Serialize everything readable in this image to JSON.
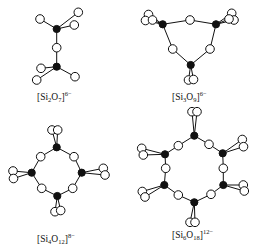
{
  "figure": {
    "width": 255,
    "height": 249,
    "colors": {
      "line": "#111111",
      "oxygen_fill": "#ffffff",
      "silicon_fill": "#111111",
      "background": "#ffffff"
    },
    "atom_radius": {
      "O": 4.3,
      "Si": 3.6
    },
    "legend_hint": "filled circle = Si, open circle = O"
  },
  "structures": [
    {
      "id": "si2o7",
      "label": {
        "prefix": "[Si",
        "n_si": "2",
        "o": "O",
        "n_o": "7",
        "close": "]",
        "charge": "6−",
        "x": 37,
        "y": 91
      },
      "si": [
        [
          56.7,
          29
        ],
        [
          56.7,
          66.7
        ]
      ],
      "o": [
        [
          56.7,
          47.7
        ],
        [
          40,
          19
        ],
        [
          78.3,
          12.3
        ],
        [
          74.3,
          25
        ],
        [
          41,
          68.3
        ],
        [
          36.7,
          80
        ],
        [
          75,
          76.7
        ]
      ],
      "bonds": [
        [
          0,
          0
        ],
        [
          0,
          1
        ],
        [
          0,
          2
        ],
        [
          0,
          3
        ],
        [
          1,
          0
        ],
        [
          1,
          4
        ],
        [
          1,
          5
        ],
        [
          1,
          6
        ]
      ]
    },
    {
      "id": "si3o9",
      "label": {
        "prefix": "[Si",
        "n_si": "3",
        "o": "O",
        "n_o": "9",
        "close": "]",
        "charge": "6−",
        "x": 172,
        "y": 91
      },
      "si": [
        [
          162.7,
          24.3
        ],
        [
          216,
          24.3
        ],
        [
          190.7,
          65
        ]
      ],
      "o": [
        [
          190,
          20
        ],
        [
          172.7,
          49
        ],
        [
          210,
          49
        ],
        [
          148.5,
          14.5
        ],
        [
          145.5,
          20.5
        ],
        [
          152.5,
          20
        ],
        [
          231.7,
          13.3
        ],
        [
          234,
          20
        ],
        [
          229,
          19
        ],
        [
          188.5,
          80
        ],
        [
          193.5,
          79.5
        ]
      ],
      "bonds": [
        [
          0,
          0
        ],
        [
          1,
          0
        ],
        [
          0,
          1
        ],
        [
          2,
          1
        ],
        [
          1,
          2
        ],
        [
          2,
          2
        ],
        [
          0,
          3
        ],
        [
          0,
          4
        ],
        [
          0,
          5
        ],
        [
          1,
          6
        ],
        [
          1,
          7
        ],
        [
          1,
          8
        ],
        [
          2,
          9
        ],
        [
          2,
          10
        ]
      ]
    },
    {
      "id": "si4o12",
      "label": {
        "prefix": "[Si",
        "n_si": "4",
        "o": "O",
        "n_o": "12",
        "close": "]",
        "charge": "8−",
        "x": 37,
        "y": 233
      },
      "si": [
        [
          56.7,
          147.3
        ],
        [
          31.7,
          172.7
        ],
        [
          81.7,
          172.7
        ],
        [
          57.3,
          196
        ]
      ],
      "o": [
        [
          40.7,
          156.7
        ],
        [
          74,
          156.7
        ],
        [
          41.7,
          188.3
        ],
        [
          72.7,
          188.3
        ],
        [
          52,
          130
        ],
        [
          57.7,
          130
        ],
        [
          13,
          171
        ],
        [
          13.5,
          178.5
        ],
        [
          103.3,
          168.3
        ],
        [
          105,
          175
        ],
        [
          55,
          211.7
        ],
        [
          60.7,
          210.5
        ]
      ],
      "bonds": [
        [
          0,
          0
        ],
        [
          1,
          0
        ],
        [
          0,
          1
        ],
        [
          2,
          1
        ],
        [
          1,
          2
        ],
        [
          3,
          2
        ],
        [
          2,
          3
        ],
        [
          3,
          3
        ],
        [
          0,
          4
        ],
        [
          0,
          5
        ],
        [
          1,
          6
        ],
        [
          1,
          7
        ],
        [
          2,
          8
        ],
        [
          2,
          9
        ],
        [
          3,
          10
        ],
        [
          3,
          11
        ]
      ]
    },
    {
      "id": "si6o18",
      "label": {
        "prefix": "[Si",
        "n_si": "6",
        "o": "O",
        "n_o": "18",
        "close": "]",
        "charge": "12−",
        "x": 172,
        "y": 229
      },
      "si": [
        [
          194.3,
          135.7
        ],
        [
          165,
          154.3
        ],
        [
          222.7,
          153.3
        ],
        [
          164.3,
          185
        ],
        [
          223.3,
          185
        ],
        [
          194.3,
          202.3
        ]
      ],
      "o": [
        [
          178.3,
          145.7
        ],
        [
          209,
          144.3
        ],
        [
          165.7,
          168.3
        ],
        [
          223.3,
          168.3
        ],
        [
          178.3,
          195
        ],
        [
          211,
          194.3
        ],
        [
          192,
          111.7
        ],
        [
          197,
          111.7
        ],
        [
          141.7,
          148.3
        ],
        [
          143.3,
          155
        ],
        [
          242.3,
          139.5
        ],
        [
          243.5,
          146.7
        ],
        [
          142.3,
          191.5
        ],
        [
          145,
          197
        ],
        [
          243.3,
          185
        ],
        [
          244.3,
          191
        ],
        [
          190,
          222.3
        ],
        [
          195,
          222.3
        ]
      ],
      "bonds": [
        [
          0,
          0
        ],
        [
          1,
          0
        ],
        [
          0,
          1
        ],
        [
          2,
          1
        ],
        [
          1,
          2
        ],
        [
          3,
          2
        ],
        [
          2,
          3
        ],
        [
          4,
          3
        ],
        [
          3,
          4
        ],
        [
          5,
          4
        ],
        [
          4,
          5
        ],
        [
          5,
          5
        ],
        [
          0,
          6
        ],
        [
          0,
          7
        ],
        [
          1,
          8
        ],
        [
          1,
          9
        ],
        [
          2,
          10
        ],
        [
          2,
          11
        ],
        [
          3,
          12
        ],
        [
          3,
          13
        ],
        [
          4,
          14
        ],
        [
          4,
          15
        ],
        [
          5,
          16
        ],
        [
          5,
          17
        ]
      ]
    }
  ]
}
